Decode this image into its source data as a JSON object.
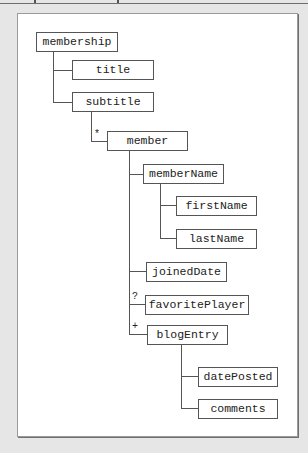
{
  "diagram": {
    "nodes": [
      {
        "id": "membership",
        "label": "membership"
      },
      {
        "id": "title",
        "label": "title"
      },
      {
        "id": "subtitle",
        "label": "subtitle"
      },
      {
        "id": "member",
        "label": "member",
        "cardinality": "*"
      },
      {
        "id": "memberName",
        "label": "memberName"
      },
      {
        "id": "firstName",
        "label": "firstName"
      },
      {
        "id": "lastName",
        "label": "lastName"
      },
      {
        "id": "joinedDate",
        "label": "joinedDate"
      },
      {
        "id": "favoritePlayer",
        "label": "favoritePlayer",
        "cardinality": "?"
      },
      {
        "id": "blogEntry",
        "label": "blogEntry",
        "cardinality": "+"
      },
      {
        "id": "datePosted",
        "label": "datePosted"
      },
      {
        "id": "comments",
        "label": "comments"
      }
    ],
    "edges": [
      [
        "membership",
        "title"
      ],
      [
        "membership",
        "subtitle"
      ],
      [
        "subtitle",
        "member"
      ],
      [
        "member",
        "memberName"
      ],
      [
        "memberName",
        "firstName"
      ],
      [
        "memberName",
        "lastName"
      ],
      [
        "member",
        "joinedDate"
      ],
      [
        "member",
        "favoritePlayer"
      ],
      [
        "member",
        "blogEntry"
      ],
      [
        "blogEntry",
        "datePosted"
      ],
      [
        "blogEntry",
        "comments"
      ]
    ],
    "cardinality_marks": {
      "member": "*",
      "favoritePlayer": "?",
      "blogEntry": "+"
    }
  }
}
